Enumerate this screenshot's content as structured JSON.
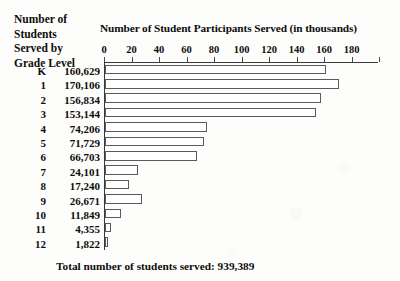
{
  "row_header": {
    "lines": [
      "Number of",
      "Students",
      "Served by",
      "Grade Level"
    ]
  },
  "footer": {
    "total_note": "Total number of students served: 939,389"
  },
  "chart_data": {
    "type": "bar",
    "orientation": "horizontal",
    "title": "Number of Student Participants Served (in thousands)",
    "xlabel": "",
    "ylabel": "Grade Level",
    "xlim": [
      0,
      200
    ],
    "grid": false,
    "legend": null,
    "bar_style": {
      "fill": "#fefefe",
      "border": "#5a5a5a"
    },
    "tick_values": [
      0,
      20,
      40,
      60,
      80,
      100,
      120,
      140,
      160,
      180,
      200
    ],
    "tick_labels": [
      "0",
      "20",
      "40",
      "60",
      "80",
      "100",
      "120",
      "140",
      "160",
      "180",
      ""
    ],
    "categories": [
      "K",
      "1",
      "2",
      "3",
      "4",
      "5",
      "6",
      "7",
      "8",
      "9",
      "10",
      "11",
      "12"
    ],
    "value_labels": [
      "160,629",
      "170,106",
      "156,834",
      "153,144",
      "74,206",
      "71,729",
      "66,703",
      "24,101",
      "17,240",
      "26,671",
      "11,849",
      "4,355",
      "1,822"
    ],
    "values": [
      160.629,
      170.106,
      156.834,
      153.144,
      74.206,
      71.729,
      66.703,
      24.101,
      17.24,
      26.671,
      11.849,
      4.355,
      1.822
    ],
    "units": "thousands of students",
    "total": 939389
  }
}
